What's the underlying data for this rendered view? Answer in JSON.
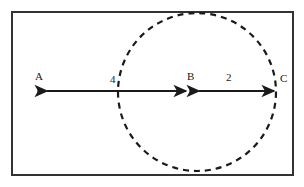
{
  "figure": {
    "background_color": "#ffffff",
    "stroke_color": "#1a1a1a",
    "frame": {
      "name": "outer-rectangle-border",
      "x": 11,
      "y": 11,
      "width": 283,
      "height": 165,
      "stroke_width": 2,
      "style": "solid"
    },
    "circle": {
      "name": "dashed-circle",
      "center_x": 197,
      "center_y": 92,
      "radius": 79,
      "stroke_width": 2,
      "style": "dashed",
      "dash_pattern": "6 5"
    },
    "line": {
      "name": "horizontal-axis-line",
      "y": 91,
      "x_start": 40,
      "x_end": 277,
      "stroke_width": 2
    },
    "points": [
      {
        "id": "A",
        "label": "A",
        "x": 40,
        "y": 91,
        "label_x": 38,
        "label_y": 79,
        "dot": true
      },
      {
        "id": "B",
        "label": "B",
        "x": 192,
        "y": 91,
        "label_x": 190,
        "label_y": 79,
        "dot": true
      },
      {
        "id": "C",
        "label": "C",
        "x": 277,
        "y": 91,
        "label_x": 281,
        "label_y": 81,
        "dot": false
      }
    ],
    "segments": [
      {
        "id": "AB",
        "name": "segment-a-to-b",
        "from": "A",
        "to": "B",
        "length_label": "4",
        "label_x": 113,
        "label_y": 82,
        "arrow_start": true,
        "arrow_end": true
      },
      {
        "id": "BC",
        "name": "segment-b-to-c",
        "from": "B",
        "to": "C",
        "length_label": "2",
        "label_x": 229,
        "label_y": 80,
        "arrow_start": true,
        "arrow_end": true
      }
    ]
  }
}
